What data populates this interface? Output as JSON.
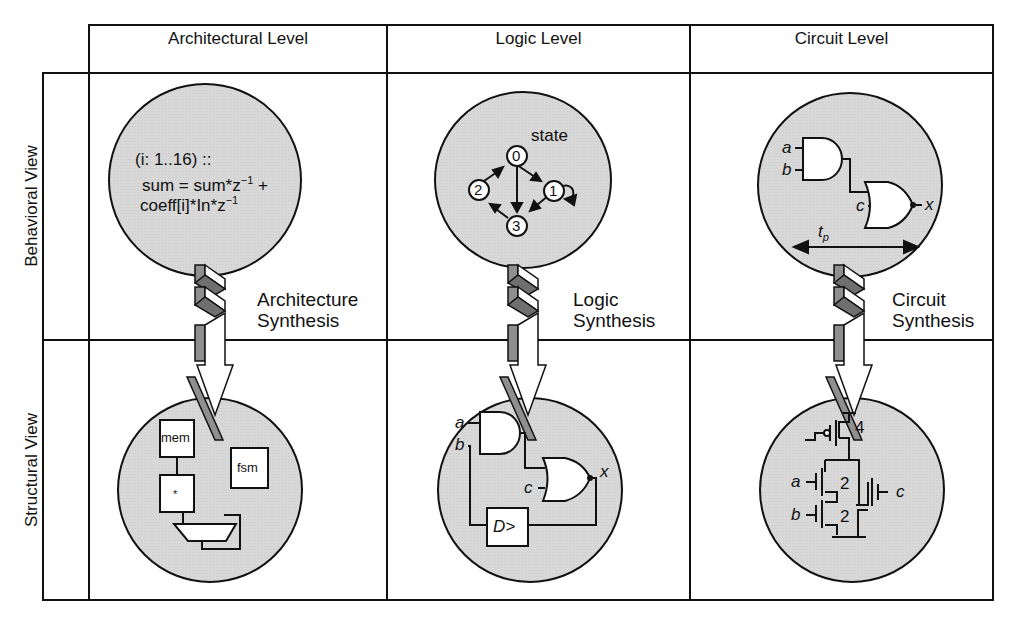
{
  "columns": [
    {
      "label": "Architectural Level"
    },
    {
      "label": "Logic Level"
    },
    {
      "label": "Circuit Level"
    }
  ],
  "rows": [
    {
      "label": "Behavioral View"
    },
    {
      "label": "Structural View"
    }
  ],
  "architectural": {
    "behavioral": {
      "line1": "(i: 1..16) ::",
      "line2": "sum = sum*z",
      "line2_sup": "−1",
      "line2_tail": " +",
      "line3": "coeff[i]*In*z",
      "line3_sup": "−1"
    },
    "synthesis": {
      "line1": "Architecture",
      "line2": "Synthesis"
    },
    "structural": {
      "mem_label": "mem",
      "mult_label": "*",
      "fsm_label": "fsm"
    }
  },
  "logic": {
    "behavioral": {
      "state_label": "state",
      "states": [
        "0",
        "1",
        "2",
        "3"
      ]
    },
    "synthesis": {
      "line1": "Logic",
      "line2": "Synthesis"
    },
    "structural": {
      "in_a": "a",
      "in_b": "b",
      "in_c": "c",
      "out_x": "x",
      "dff_label": "D>"
    }
  },
  "circuit": {
    "behavioral": {
      "in_a": "a",
      "in_b": "b",
      "in_c": "c",
      "out_x": "x",
      "delay_label": "t",
      "delay_sub": "p"
    },
    "synthesis": {
      "line1": "Circuit",
      "line2": "Synthesis"
    },
    "structural": {
      "in_a": "a",
      "in_b": "b",
      "in_c": "c",
      "size_p": "4",
      "size_na": "2",
      "size_nb": "2"
    }
  },
  "colors": {
    "bubble_fill": "#d9d9d9",
    "arrow_gray": "#8f8f8f",
    "line": "#111111"
  }
}
